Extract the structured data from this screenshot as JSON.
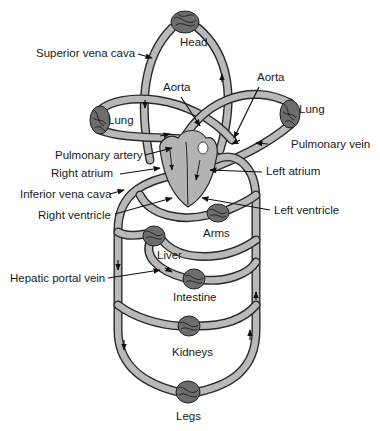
{
  "colors": {
    "vessel_fill": "#b9b9b9",
    "vessel_outline": "#2a2a2a",
    "capillary_fill": "#6d6d6d",
    "heart_fill": "#b3b3b3",
    "text": "#1a1a1a",
    "background": "#ffffff"
  },
  "organs": {
    "head": "Head",
    "lung_left": "Lung",
    "lung_right": "Lung",
    "arms": "Arms",
    "liver": "Liver",
    "intestine": "Intestine",
    "kidneys": "Kidneys",
    "legs": "Legs"
  },
  "labels": {
    "superior_vena_cava": "Superior vena cava",
    "aorta_center": "Aorta",
    "aorta_right": "Aorta",
    "pulmonary_artery": "Pulmonary artery",
    "pulmonary_vein": "Pulmonary vein",
    "right_atrium": "Right atrium",
    "left_atrium": "Left atrium",
    "inferior_vena_cava": "Inferior vena cava",
    "right_ventricle": "Right ventricle",
    "left_ventricle": "Left ventricle",
    "hepatic_portal_vein": "Hepatic portal vein"
  }
}
